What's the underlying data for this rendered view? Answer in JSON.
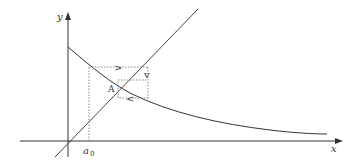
{
  "diagram": {
    "type": "cobweb-fixed-point",
    "axes": {
      "x_label": "x",
      "y_label": "y"
    },
    "labels": {
      "start_point": "a",
      "start_subscript": "0",
      "fixed_point": "A"
    },
    "arrows": {
      "right": ">",
      "down": "v",
      "left": "<"
    },
    "colors": {
      "axis": "#333333",
      "curve": "#333333",
      "diagonal": "#444444",
      "dotted": "#888888",
      "background": "#ffffff"
    }
  }
}
